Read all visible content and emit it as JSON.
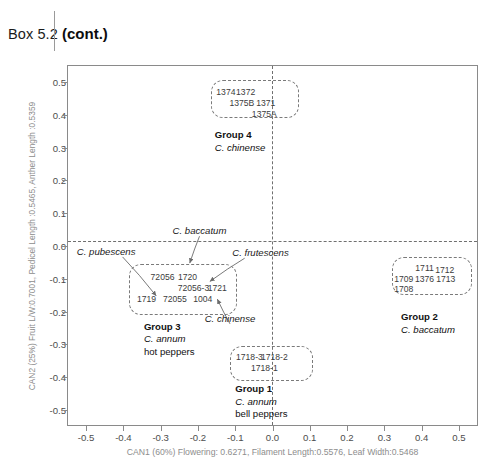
{
  "header": {
    "box_label": "Box 5.2",
    "cont_label": "(cont.)"
  },
  "chart_data": {
    "type": "scatter",
    "title": "",
    "xlabel": "CAN1 (60%) Flowering: 0.6271, Filament Length:0.5576, Leaf Width:0.5468",
    "ylabel": "CAN2 (25%) Fruit L/W:0.7001, Pedicel Length :0.5465, Anther Length :0.5359",
    "xlim": [
      -0.55,
      0.55
    ],
    "ylim": [
      -0.55,
      0.55
    ],
    "xticks": [
      "-0.5",
      "-0.4",
      "-0.3",
      "-0.2",
      "-0.1",
      "0.0",
      "0.1",
      "0.2",
      "0.3",
      "0.4",
      "0.5"
    ],
    "xtick_values": [
      -0.5,
      -0.4,
      -0.3,
      -0.2,
      -0.1,
      0.0,
      0.1,
      0.2,
      0.3,
      0.4,
      0.5
    ],
    "yticks": [
      "0.5",
      "0.4",
      "0.3",
      "0.2",
      "0.1",
      "0.0",
      "-0.1",
      "-0.2",
      "-0.3",
      "-0.4",
      "-0.5"
    ],
    "ytick_values": [
      0.5,
      0.4,
      0.3,
      0.2,
      0.1,
      0.0,
      -0.1,
      -0.2,
      -0.3,
      -0.4,
      -0.5
    ],
    "grid": false,
    "legend": "none",
    "reference_lines": [
      {
        "axis": "horizontal",
        "value": 0.0,
        "style": "dashed"
      },
      {
        "axis": "vertical",
        "value": 0.0,
        "style": "dashed"
      }
    ],
    "clusters": [
      {
        "id": "group-4",
        "name": "Group 4",
        "species": "C. chinense",
        "common": "",
        "box": {
          "x": -0.165,
          "y": 0.505,
          "w": 0.235,
          "h": 0.115
        },
        "accessions": [
          {
            "label": "1374",
            "x": -0.125,
            "y": 0.468
          },
          {
            "label": "1372",
            "x": -0.072,
            "y": 0.468
          },
          {
            "label": "1375B",
            "x": -0.082,
            "y": 0.435
          },
          {
            "label": "1371",
            "x": -0.018,
            "y": 0.435
          },
          {
            "label": "1375A",
            "x": -0.022,
            "y": 0.402
          }
        ],
        "caption_pos": {
          "x": -0.155,
          "y": 0.355
        }
      },
      {
        "id": "group-3",
        "name": "Group 3",
        "species": "C. annum",
        "common": "hot peppers",
        "box": {
          "x": -0.385,
          "y": -0.055,
          "w": 0.29,
          "h": 0.155
        },
        "accessions": [
          {
            "label": "72056",
            "x": -0.295,
            "y": -0.093
          },
          {
            "label": "1720",
            "x": -0.228,
            "y": -0.093
          },
          {
            "label": "72056-3",
            "x": -0.212,
            "y": -0.128
          },
          {
            "label": "1721",
            "x": -0.148,
            "y": -0.128
          },
          {
            "label": "1719",
            "x": -0.338,
            "y": -0.162
          },
          {
            "label": "72055",
            "x": -0.262,
            "y": -0.162
          },
          {
            "label": "1004",
            "x": -0.187,
            "y": -0.162
          }
        ],
        "caption_pos": {
          "x": -0.345,
          "y": -0.228
        }
      },
      {
        "id": "group-2",
        "name": "Group 2",
        "species": "C. baccatum",
        "common": "",
        "box": {
          "x": 0.32,
          "y": -0.035,
          "w": 0.215,
          "h": 0.115
        },
        "accessions": [
          {
            "label": "1711",
            "x": 0.408,
            "y": -0.068
          },
          {
            "label": "1712",
            "x": 0.462,
            "y": -0.072
          },
          {
            "label": "1709",
            "x": 0.352,
            "y": -0.102
          },
          {
            "label": "1376",
            "x": 0.408,
            "y": -0.102
          },
          {
            "label": "1713",
            "x": 0.465,
            "y": -0.102
          },
          {
            "label": "1708",
            "x": 0.352,
            "y": -0.132
          }
        ],
        "caption_pos": {
          "x": 0.345,
          "y": -0.198
        }
      },
      {
        "id": "group-1",
        "name": "Group 1",
        "species": "C. annum",
        "common": "bell peppers",
        "box": {
          "x": -0.115,
          "y": -0.305,
          "w": 0.225,
          "h": 0.105
        },
        "accessions": [
          {
            "label": "1718-3",
            "x": -0.062,
            "y": -0.338
          },
          {
            "label": "1718-2",
            "x": 0.005,
            "y": -0.338
          },
          {
            "label": "1718-1",
            "x": -0.022,
            "y": -0.372
          }
        ],
        "caption_pos": {
          "x": -0.1,
          "y": -0.418
        }
      }
    ],
    "annotations": [
      {
        "id": "c-baccatum",
        "label": "C. baccatum",
        "x": -0.268,
        "y": 0.045,
        "target_x": -0.222,
        "target_y": -0.052
      },
      {
        "id": "c-pubescens",
        "label": "C. pubescens",
        "x": -0.525,
        "y": -0.018,
        "target_x": -0.312,
        "target_y": -0.152
      },
      {
        "id": "c-frutescens",
        "label": "C. frutescens",
        "x": -0.108,
        "y": -0.022,
        "target_x": -0.168,
        "target_y": -0.108
      },
      {
        "id": "c-chinense",
        "label": "C. chinense",
        "x": -0.182,
        "y": -0.222,
        "target_x": -0.148,
        "target_y": -0.162
      }
    ]
  }
}
